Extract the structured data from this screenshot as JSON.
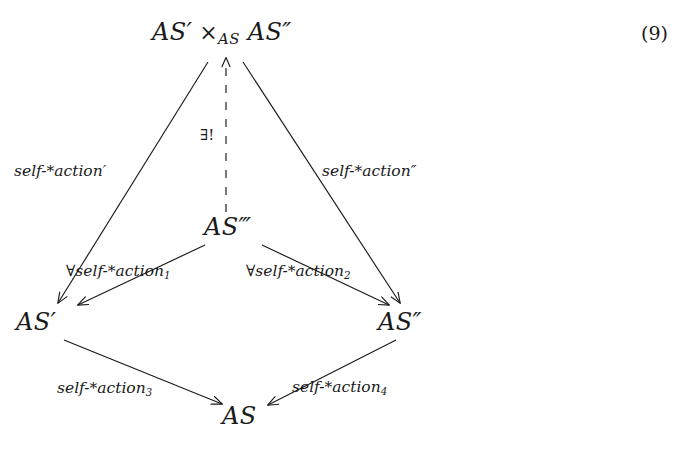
{
  "figure": {
    "kind": "commutative-diagram",
    "equation_number": "(9)",
    "background_color": "#ffffff",
    "ink_color": "#1a1a1a"
  },
  "nodes": {
    "apex": {
      "id": "apex",
      "base": "AS",
      "primes": "′",
      "operator": "×",
      "operator_subscript": "AS",
      "second": "AS",
      "second_primes": "″",
      "x": 222,
      "y": 33
    },
    "middle": {
      "id": "middle",
      "base": "AS",
      "primes": "‴",
      "x": 230,
      "y": 228,
      "label": "AS‴"
    },
    "left": {
      "id": "left",
      "base": "AS",
      "primes": "′",
      "x": 40,
      "y": 323,
      "label": "AS′"
    },
    "right": {
      "id": "right",
      "base": "AS",
      "primes": "″",
      "x": 400,
      "y": 323,
      "label": "AS″"
    },
    "bottom": {
      "id": "bottom",
      "base": "AS",
      "primes": "",
      "x": 243,
      "y": 417,
      "label": "AS"
    }
  },
  "edge_labels": {
    "apex_to_left": {
      "text": "self-*action′",
      "x": 14,
      "y": 175
    },
    "apex_to_right": {
      "text": "self-*action″",
      "x": 322,
      "y": 175
    },
    "middle_to_apex": {
      "text": "∃!",
      "x": 200,
      "y": 128
    },
    "middle_to_left": {
      "text": "∀self-*action",
      "subscript": "1",
      "x": 67,
      "y": 280
    },
    "middle_to_right": {
      "text": "∀self-*action",
      "subscript": "2",
      "x": 246,
      "y": 280
    },
    "left_to_bottom": {
      "text": "self-*action",
      "subscript": "3",
      "x": 58,
      "y": 394
    },
    "right_to_bottom": {
      "text": "self-*action",
      "subscript": "4",
      "x": 292,
      "y": 392
    }
  },
  "edges": [
    {
      "id": "apex-to-left",
      "from": "apex",
      "to": "left",
      "style": "solid",
      "arrow": "to-target",
      "label_key": "apex_to_left"
    },
    {
      "id": "apex-to-right",
      "from": "apex",
      "to": "right",
      "style": "solid",
      "arrow": "to-target",
      "label_key": "apex_to_right"
    },
    {
      "id": "middle-to-apex",
      "from": "middle",
      "to": "apex",
      "style": "dashed",
      "arrow": "to-target",
      "label_key": "middle_to_apex"
    },
    {
      "id": "middle-to-left",
      "from": "middle",
      "to": "left",
      "style": "solid",
      "arrow": "to-target",
      "label_key": "middle_to_left"
    },
    {
      "id": "middle-to-right",
      "from": "middle",
      "to": "right",
      "style": "solid",
      "arrow": "to-target",
      "label_key": "middle_to_right"
    },
    {
      "id": "left-to-bottom",
      "from": "left",
      "to": "bottom",
      "style": "solid",
      "arrow": "to-target",
      "label_key": "left_to_bottom"
    },
    {
      "id": "right-to-bottom",
      "from": "right",
      "to": "bottom",
      "style": "solid",
      "arrow": "to-target",
      "label_key": "right_to_bottom"
    }
  ]
}
